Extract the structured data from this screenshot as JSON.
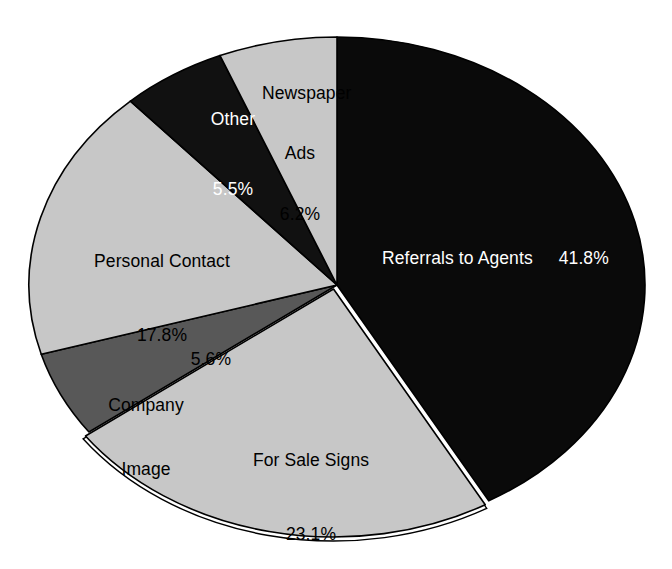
{
  "chart_data": {
    "type": "pie",
    "title": "",
    "subtitle": "",
    "xlabel": "",
    "ylabel": "",
    "legend_position": "none",
    "grid": false,
    "units": "percent",
    "start_angle_deg": 0,
    "direction": "clockwise",
    "categories": [
      "Referrals to Agents",
      "For Sale Signs",
      "Company Image",
      "Personal Contact",
      "Other",
      "Newspaper Ads"
    ],
    "values": [
      41.8,
      23.1,
      5.6,
      17.8,
      5.5,
      6.2
    ],
    "slices": [
      {
        "label": "Referrals to Agents",
        "value": 41.8,
        "value_text": "41.8%",
        "color": "#0a0a0a",
        "text_color": "#ffffff",
        "start_deg": 0.0,
        "end_deg": 150.48,
        "exploded": false
      },
      {
        "label": "For Sale Signs",
        "value": 23.1,
        "value_text": "23.1%",
        "color": "#c7c7c7",
        "text_color": "#000000",
        "start_deg": 150.48,
        "end_deg": 233.64,
        "exploded": true
      },
      {
        "label": "Company Image",
        "value": 5.6,
        "value_text": "5.6%",
        "color": "#585858",
        "text_color": "#000000",
        "start_deg": 233.64,
        "end_deg": 253.8,
        "exploded": false
      },
      {
        "label": "Personal Contact",
        "value": 17.8,
        "value_text": "17.8%",
        "color": "#c7c7c7",
        "text_color": "#000000",
        "start_deg": 253.8,
        "end_deg": 317.88,
        "exploded": false
      },
      {
        "label": "Other",
        "value": 5.5,
        "value_text": "5.5%",
        "color": "#111111",
        "text_color": "#ffffff",
        "start_deg": 317.88,
        "end_deg": 337.68,
        "exploded": false
      },
      {
        "label": "Newspaper Ads",
        "value": 6.2,
        "value_text": "6.2%",
        "color": "#c7c7c7",
        "text_color": "#000000",
        "start_deg": 337.68,
        "end_deg": 360.0,
        "exploded": false
      }
    ],
    "labels": {
      "referrals": {
        "name": "Referrals to Agents",
        "pct": "41.8%"
      },
      "for_sale_signs": {
        "name": "For Sale Signs",
        "pct": "23.1%"
      },
      "company_image": {
        "name_line1": "Company",
        "name_line2": "Image",
        "pct": "5.6%"
      },
      "personal_contact": {
        "name": "Personal Contact",
        "pct": "17.8%"
      },
      "other": {
        "name": "Other",
        "pct": "5.5%"
      },
      "newspaper_ads": {
        "name_line1": "Newspaper",
        "name_line2": "Ads",
        "pct": "6.2%"
      }
    }
  },
  "colors": {
    "background": "#ffffff",
    "dark": "#0a0a0a",
    "mid_gray": "#585858",
    "light_gray": "#c7c7c7",
    "outline": "#000000"
  }
}
